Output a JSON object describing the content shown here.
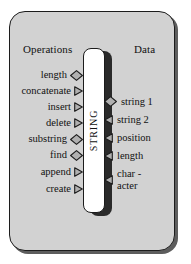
{
  "diagram": {
    "title": "STRING",
    "class_name": "STRING",
    "headers": {
      "left": "Operations",
      "right": "Data"
    },
    "operations": [
      {
        "label": "length",
        "marker": "diamond-icon",
        "top": 70
      },
      {
        "label": "concatenate",
        "marker": "triangle-icon",
        "top": 86
      },
      {
        "label": "insert",
        "marker": "triangle-icon",
        "top": 102
      },
      {
        "label": "delete",
        "marker": "triangle-icon",
        "top": 118
      },
      {
        "label": "substring",
        "marker": "diamond-icon",
        "top": 134
      },
      {
        "label": "find",
        "marker": "diamond-icon",
        "top": 150
      },
      {
        "label": "append",
        "marker": "triangle-icon",
        "top": 167
      },
      {
        "label": "create",
        "marker": "triangle-icon",
        "top": 184
      }
    ],
    "data_items": [
      {
        "label": "string 1",
        "marker": "diamond-icon",
        "top": 96
      },
      {
        "label": "string 2",
        "marker": "triangle-left-icon",
        "top": 114
      },
      {
        "label": "position",
        "marker": "triangle-left-icon",
        "top": 132
      },
      {
        "label": "length",
        "marker": "triangle-left-icon",
        "top": 150
      },
      {
        "label": "char -\nacter",
        "marker": "triangle-left-icon",
        "top": 168
      }
    ],
    "colors": {
      "panel_fill": "#d2d2d2",
      "panel_border": "#1c1c1c",
      "panel_shadow": "#5d5d5d",
      "class_fill": "#ffffff",
      "class_shadow": "#2a2a2a",
      "marker_fill": "#b0b0b0",
      "marker_stroke": "#1c1c1c",
      "text": "#111111",
      "background": "#ffffff"
    }
  }
}
